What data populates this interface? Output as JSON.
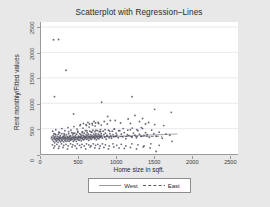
{
  "chart_data": {
    "type": "scatter",
    "title": "Scatterplot with Regression–Lines",
    "xlabel": "Home size in sqft.",
    "ylabel": "Rent monthly/Fitted values",
    "xlim": [
      0,
      2600
    ],
    "ylim": [
      0,
      2600
    ],
    "xticks": [
      0,
      500,
      1000,
      1500,
      2000,
      2500
    ],
    "yticks": [
      0,
      500,
      1000,
      1500,
      2000,
      2500
    ],
    "xtick_labels": [
      "0",
      "500",
      "1000",
      "1500",
      "2000",
      "2500"
    ],
    "ytick_labels": [
      "0",
      "500",
      "1000",
      "1500",
      "2000",
      "2500"
    ],
    "grid": "horizontal-faint",
    "legend_position": "below-plot",
    "marker": {
      "shape": "circle",
      "size_px": 1.5,
      "color": "#4a4a5a"
    },
    "series": [
      {
        "name": "West",
        "type": "regression-line",
        "style": "solid",
        "color": "#8f8f9c",
        "line_points": [
          [
            120,
            300
          ],
          [
            1800,
            395
          ]
        ]
      },
      {
        "name": "East",
        "type": "regression-line",
        "style": "dashed",
        "color": "#5a5a66",
        "line_points": [
          [
            150,
            330
          ],
          [
            1600,
            350
          ]
        ]
      }
    ],
    "annotations": [
      {
        "text": "two high outliers near 2250",
        "x": 200,
        "y": 2250
      },
      {
        "text": "outlier near 1650",
        "x": 330,
        "y": 1650
      }
    ],
    "points": [
      [
        165,
        2250
      ],
      [
        232,
        2255
      ],
      [
        330,
        1650
      ],
      [
        178,
        1130
      ],
      [
        1200,
        1130
      ],
      [
        800,
        1020
      ],
      [
        1500,
        880
      ],
      [
        1720,
        820
      ],
      [
        430,
        790
      ],
      [
        880,
        740
      ],
      [
        1240,
        760
      ],
      [
        1340,
        700
      ],
      [
        1150,
        690
      ],
      [
        980,
        660
      ],
      [
        1300,
        640
      ],
      [
        1420,
        620
      ],
      [
        620,
        620
      ],
      [
        700,
        640
      ],
      [
        760,
        600
      ],
      [
        1050,
        610
      ],
      [
        1180,
        600
      ],
      [
        1380,
        590
      ],
      [
        1500,
        580
      ],
      [
        1620,
        560
      ],
      [
        520,
        580
      ],
      [
        560,
        600
      ],
      [
        600,
        560
      ],
      [
        640,
        590
      ],
      [
        680,
        570
      ],
      [
        720,
        610
      ],
      [
        140,
        330
      ],
      [
        150,
        280
      ],
      [
        160,
        360
      ],
      [
        165,
        250
      ],
      [
        170,
        400
      ],
      [
        175,
        300
      ],
      [
        180,
        220
      ],
      [
        185,
        340
      ],
      [
        190,
        280
      ],
      [
        195,
        380
      ],
      [
        200,
        250
      ],
      [
        205,
        310
      ],
      [
        210,
        270
      ],
      [
        215,
        350
      ],
      [
        220,
        300
      ],
      [
        225,
        230
      ],
      [
        230,
        390
      ],
      [
        235,
        280
      ],
      [
        240,
        330
      ],
      [
        245,
        260
      ],
      [
        250,
        300
      ],
      [
        255,
        360
      ],
      [
        260,
        240
      ],
      [
        265,
        320
      ],
      [
        270,
        280
      ],
      [
        275,
        400
      ],
      [
        280,
        260
      ],
      [
        285,
        330
      ],
      [
        290,
        290
      ],
      [
        295,
        350
      ],
      [
        300,
        240
      ],
      [
        305,
        310
      ],
      [
        310,
        370
      ],
      [
        315,
        270
      ],
      [
        320,
        330
      ],
      [
        325,
        290
      ],
      [
        330,
        250
      ],
      [
        335,
        380
      ],
      [
        340,
        300
      ],
      [
        345,
        340
      ],
      [
        350,
        260
      ],
      [
        355,
        320
      ],
      [
        360,
        290
      ],
      [
        365,
        400
      ],
      [
        370,
        250
      ],
      [
        375,
        350
      ],
      [
        380,
        300
      ],
      [
        385,
        270
      ],
      [
        390,
        360
      ],
      [
        395,
        310
      ],
      [
        400,
        280
      ],
      [
        405,
        420
      ],
      [
        410,
        330
      ],
      [
        415,
        290
      ],
      [
        420,
        380
      ],
      [
        425,
        250
      ],
      [
        430,
        340
      ],
      [
        435,
        300
      ],
      [
        440,
        270
      ],
      [
        445,
        410
      ],
      [
        450,
        320
      ],
      [
        455,
        360
      ],
      [
        460,
        290
      ],
      [
        465,
        250
      ],
      [
        470,
        390
      ],
      [
        475,
        330
      ],
      [
        480,
        300
      ],
      [
        485,
        430
      ],
      [
        490,
        280
      ],
      [
        495,
        350
      ],
      [
        500,
        320
      ],
      [
        505,
        270
      ],
      [
        510,
        400
      ],
      [
        515,
        340
      ],
      [
        520,
        300
      ],
      [
        525,
        380
      ],
      [
        530,
        260
      ],
      [
        535,
        350
      ],
      [
        540,
        310
      ],
      [
        545,
        440
      ],
      [
        550,
        290
      ],
      [
        555,
        370
      ],
      [
        560,
        330
      ],
      [
        565,
        280
      ],
      [
        570,
        410
      ],
      [
        575,
        350
      ],
      [
        580,
        300
      ],
      [
        585,
        460
      ],
      [
        590,
        320
      ],
      [
        595,
        380
      ],
      [
        600,
        340
      ],
      [
        605,
        290
      ],
      [
        610,
        420
      ],
      [
        615,
        360
      ],
      [
        620,
        310
      ],
      [
        625,
        390
      ],
      [
        630,
        270
      ],
      [
        635,
        350
      ],
      [
        640,
        330
      ],
      [
        645,
        450
      ],
      [
        650,
        300
      ],
      [
        655,
        380
      ],
      [
        660,
        340
      ],
      [
        665,
        290
      ],
      [
        670,
        430
      ],
      [
        675,
        360
      ],
      [
        680,
        320
      ],
      [
        685,
        470
      ],
      [
        690,
        330
      ],
      [
        695,
        390
      ],
      [
        700,
        350
      ],
      [
        705,
        300
      ],
      [
        710,
        440
      ],
      [
        715,
        370
      ],
      [
        720,
        320
      ],
      [
        725,
        400
      ],
      [
        730,
        280
      ],
      [
        735,
        360
      ],
      [
        740,
        340
      ],
      [
        745,
        460
      ],
      [
        750,
        310
      ],
      [
        755,
        390
      ],
      [
        760,
        350
      ],
      [
        765,
        300
      ],
      [
        770,
        440
      ],
      [
        775,
        370
      ],
      [
        780,
        330
      ],
      [
        785,
        480
      ],
      [
        790,
        340
      ],
      [
        795,
        400
      ],
      [
        800,
        360
      ],
      [
        810,
        310
      ],
      [
        820,
        450
      ],
      [
        830,
        380
      ],
      [
        840,
        330
      ],
      [
        850,
        410
      ],
      [
        860,
        290
      ],
      [
        870,
        370
      ],
      [
        880,
        350
      ],
      [
        890,
        470
      ],
      [
        900,
        320
      ],
      [
        910,
        400
      ],
      [
        920,
        360
      ],
      [
        930,
        310
      ],
      [
        940,
        450
      ],
      [
        950,
        380
      ],
      [
        960,
        340
      ],
      [
        970,
        490
      ],
      [
        980,
        350
      ],
      [
        990,
        410
      ],
      [
        1000,
        370
      ],
      [
        1020,
        320
      ],
      [
        1040,
        460
      ],
      [
        1060,
        390
      ],
      [
        1080,
        340
      ],
      [
        1100,
        420
      ],
      [
        1120,
        300
      ],
      [
        1140,
        380
      ],
      [
        1160,
        360
      ],
      [
        1180,
        480
      ],
      [
        1200,
        330
      ],
      [
        1220,
        410
      ],
      [
        1240,
        370
      ],
      [
        1260,
        320
      ],
      [
        1280,
        460
      ],
      [
        1300,
        390
      ],
      [
        1320,
        350
      ],
      [
        1340,
        500
      ],
      [
        1360,
        360
      ],
      [
        1380,
        420
      ],
      [
        1400,
        380
      ],
      [
        1430,
        330
      ],
      [
        1460,
        470
      ],
      [
        1490,
        400
      ],
      [
        1520,
        350
      ],
      [
        1560,
        430
      ],
      [
        1600,
        310
      ],
      [
        1650,
        390
      ],
      [
        1700,
        370
      ],
      [
        1730,
        250
      ],
      [
        150,
        180
      ],
      [
        180,
        160
      ],
      [
        210,
        190
      ],
      [
        240,
        150
      ],
      [
        270,
        200
      ],
      [
        300,
        170
      ],
      [
        330,
        190
      ],
      [
        360,
        160
      ],
      [
        390,
        200
      ],
      [
        420,
        180
      ],
      [
        450,
        160
      ],
      [
        480,
        200
      ],
      [
        510,
        170
      ],
      [
        540,
        190
      ],
      [
        570,
        160
      ],
      [
        600,
        200
      ],
      [
        630,
        180
      ],
      [
        660,
        160
      ],
      [
        690,
        200
      ],
      [
        720,
        170
      ],
      [
        750,
        190
      ],
      [
        780,
        160
      ],
      [
        810,
        200
      ],
      [
        850,
        180
      ],
      [
        900,
        160
      ],
      [
        950,
        200
      ],
      [
        1000,
        170
      ],
      [
        1060,
        190
      ],
      [
        1120,
        160
      ],
      [
        1200,
        200
      ],
      [
        1280,
        180
      ],
      [
        1360,
        160
      ],
      [
        1450,
        200
      ],
      [
        1520,
        50
      ],
      [
        1560,
        170
      ],
      [
        155,
        450
      ],
      [
        195,
        480
      ],
      [
        235,
        430
      ],
      [
        275,
        500
      ],
      [
        315,
        460
      ],
      [
        355,
        520
      ],
      [
        395,
        470
      ],
      [
        435,
        540
      ],
      [
        475,
        490
      ],
      [
        515,
        560
      ],
      [
        555,
        510
      ],
      [
        595,
        580
      ],
      [
        635,
        530
      ],
      [
        675,
        600
      ],
      [
        715,
        550
      ],
      [
        755,
        620
      ],
      [
        795,
        570
      ],
      [
        835,
        640
      ],
      [
        875,
        590
      ],
      [
        915,
        660
      ],
      [
        170,
        120
      ],
      [
        230,
        110
      ],
      [
        290,
        130
      ],
      [
        350,
        100
      ],
      [
        410,
        140
      ],
      [
        470,
        110
      ],
      [
        530,
        130
      ],
      [
        590,
        100
      ],
      [
        650,
        140
      ],
      [
        710,
        120
      ],
      [
        770,
        110
      ],
      [
        830,
        130
      ],
      [
        890,
        100
      ],
      [
        960,
        140
      ],
      [
        1030,
        120
      ],
      [
        1100,
        110
      ],
      [
        1180,
        130
      ],
      [
        1260,
        100
      ],
      [
        1350,
        140
      ],
      [
        1440,
        120
      ],
      [
        185,
        390
      ],
      [
        245,
        420
      ],
      [
        305,
        400
      ],
      [
        365,
        440
      ],
      [
        425,
        410
      ],
      [
        485,
        450
      ],
      [
        545,
        420
      ],
      [
        605,
        460
      ],
      [
        665,
        430
      ],
      [
        725,
        470
      ],
      [
        785,
        440
      ],
      [
        845,
        480
      ],
      [
        905,
        450
      ],
      [
        965,
        490
      ],
      [
        1025,
        460
      ],
      [
        1085,
        500
      ],
      [
        1145,
        470
      ],
      [
        1205,
        510
      ],
      [
        1265,
        480
      ],
      [
        1325,
        520
      ]
    ]
  },
  "legend": {
    "entries": [
      {
        "label": "West",
        "style": "solid"
      },
      {
        "label": "East",
        "style": "dashed"
      }
    ]
  }
}
